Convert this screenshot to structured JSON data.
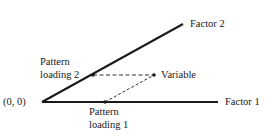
{
  "diagram": {
    "type": "factor-pattern-loading-geometry",
    "origin_label": "(0, 0)",
    "axes": [
      {
        "id": "factor1",
        "label": "Factor 1",
        "from": [
          42,
          102
        ],
        "to": [
          218,
          102
        ]
      },
      {
        "id": "factor2",
        "label": "Factor 2",
        "from": [
          42,
          102
        ],
        "to": [
          183,
          24
        ]
      }
    ],
    "points": [
      {
        "id": "variable",
        "label": "Variable",
        "x": 154,
        "y": 75
      },
      {
        "id": "loading2",
        "label_line1": "Pattern",
        "label_line2": "loading 2",
        "x": 93,
        "y": 75
      },
      {
        "id": "loading1",
        "label_line1": "Pattern",
        "label_line2": "loading 1",
        "x": 105,
        "y": 102
      }
    ],
    "projections": [
      {
        "from": "variable",
        "to": "loading2",
        "style": "dashed",
        "parallel_to": "factor1"
      },
      {
        "from": "variable",
        "to": "loading1",
        "style": "dashed",
        "parallel_to": "factor2"
      }
    ],
    "colors": {
      "line": "#1a1a1a",
      "background": "#ffffff"
    }
  }
}
